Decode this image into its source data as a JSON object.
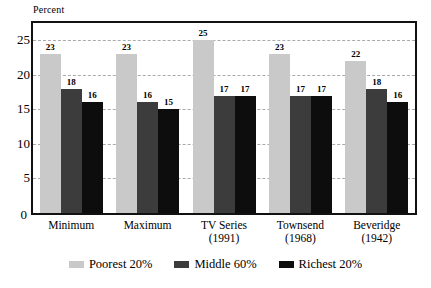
{
  "chart_data": {
    "type": "bar",
    "title": "",
    "subtitle": "",
    "xlabel": "",
    "ylabel": "Percent",
    "ylim": [
      0,
      27.5
    ],
    "yticks": [
      0,
      5,
      10,
      15,
      20,
      25
    ],
    "ytick_labels": [
      "0",
      "5",
      "10",
      "15",
      "20",
      "25"
    ],
    "minor_tick_step": 2.5,
    "grid": "horizontal-dashed-at-major-ticks",
    "legend_position": "bottom-center",
    "categories": [
      "Minimum",
      "Maximum",
      "TV Series",
      "Townsend",
      "Beveridge"
    ],
    "category_sublabels": [
      "",
      "",
      "(1991)",
      "(1968)",
      "(1942)"
    ],
    "series": [
      {
        "name": "Poorest 20%",
        "color": "#c9c9c9",
        "values": [
          23,
          23,
          25,
          23,
          22
        ]
      },
      {
        "name": "Middle 60%",
        "color": "#3c3c3c",
        "values": [
          18,
          16,
          17,
          17,
          18
        ]
      },
      {
        "name": "Richest 20%",
        "color": "#0d0d0d",
        "values": [
          16,
          15,
          17,
          17,
          16
        ]
      }
    ],
    "value_labels": [
      [
        "23",
        "18",
        "16"
      ],
      [
        "23",
        "16",
        "15"
      ],
      [
        "25",
        "17",
        "17"
      ],
      [
        "23",
        "17",
        "17"
      ],
      [
        "22",
        "18",
        "16"
      ]
    ]
  },
  "axis": {
    "y_title": "Percent",
    "zero_label": "0"
  },
  "legend": {
    "items": [
      {
        "label": "Poorest 20%",
        "swatch": "poorest"
      },
      {
        "label": "Middle 60%",
        "swatch": "middle"
      },
      {
        "label": "Richest 20%",
        "swatch": "richest"
      }
    ]
  }
}
